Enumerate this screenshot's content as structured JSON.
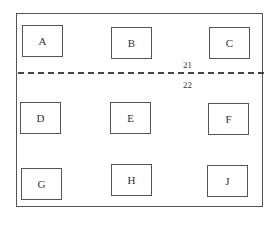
{
  "diagram": {
    "boxes": [
      {
        "id": "A",
        "label": "A"
      },
      {
        "id": "B",
        "label": "B"
      },
      {
        "id": "C",
        "label": "C"
      },
      {
        "id": "D",
        "label": "D"
      },
      {
        "id": "E",
        "label": "E"
      },
      {
        "id": "F",
        "label": "F"
      },
      {
        "id": "G",
        "label": "G"
      },
      {
        "id": "H",
        "label": "H"
      },
      {
        "id": "J",
        "label": "J"
      }
    ],
    "divider": {
      "label_above": "21",
      "label_below": "22"
    }
  }
}
